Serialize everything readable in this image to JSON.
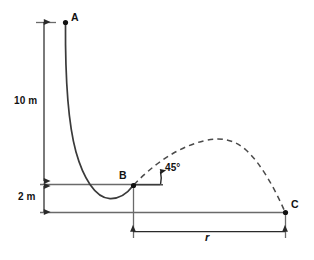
{
  "figure": {
    "type": "physics-kinematics-diagram",
    "background_color": "#ffffff",
    "line_color": "#555555",
    "curve_color": "#3a3a3a",
    "text_color": "#121212",
    "points": [
      {
        "id": "A",
        "label": "A",
        "x": 65,
        "y": 22,
        "label_dx": 5,
        "label_dy": -11
      },
      {
        "id": "B",
        "label": "B",
        "x": 133,
        "y": 185,
        "label_dx": -14,
        "label_dy": -15
      },
      {
        "id": "C",
        "label": "C",
        "x": 285,
        "y": 212,
        "label_dx": 5,
        "label_dy": -14
      }
    ],
    "dimensions": [
      {
        "id": "height-upper",
        "label": "10 m",
        "value": 10,
        "unit": "m",
        "orientation": "vertical",
        "from_y": 22,
        "to_y": 181,
        "x": 44,
        "label_x": 14,
        "label_y": 100
      },
      {
        "id": "height-lower",
        "label": "2 m",
        "value": 2,
        "unit": "m",
        "orientation": "vertical",
        "from_y": 185,
        "to_y": 212,
        "x": 44,
        "label_x": 18,
        "label_y": 193
      },
      {
        "id": "range",
        "label": "r",
        "orientation": "horizontal",
        "from_x": 133,
        "to_x": 285,
        "y": 231,
        "label_x": 205,
        "label_y": 235
      }
    ],
    "angle": {
      "label": "45°",
      "value": 45,
      "unit": "degrees",
      "vertex_x": 133,
      "vertex_y": 185,
      "label_x": 165,
      "label_y": 163
    },
    "curves": [
      {
        "id": "ramp-A-to-B",
        "style": "solid",
        "description": "Solid ramp curve from A descending steeply then rising to B"
      },
      {
        "id": "trajectory-B-to-C",
        "style": "dashed",
        "description": "Dashed projectile parabola launched from B at 45 degrees landing at C"
      }
    ],
    "reference_lines": [
      {
        "id": "level-B",
        "orientation": "horizontal",
        "y": 184,
        "from_x": 40,
        "to_x": 160
      },
      {
        "id": "ground",
        "orientation": "horizontal",
        "y": 212,
        "from_x": 40,
        "to_x": 285
      }
    ]
  }
}
